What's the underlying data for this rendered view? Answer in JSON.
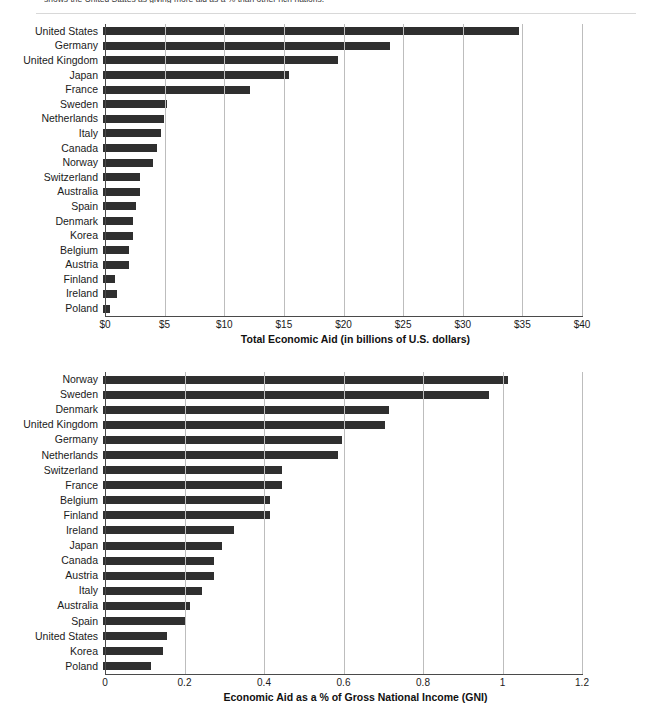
{
  "page": {
    "top_caption": "shows the United States as giving more aid as a % than other rich nations."
  },
  "chart_data": [
    {
      "id": "total-economic-aid",
      "type": "bar",
      "orientation": "horizontal",
      "title": "",
      "xlabel": "Total Economic Aid (in billions of U.S. dollars)",
      "ylabel": "",
      "xlim": [
        0,
        40
      ],
      "xticks": [
        0,
        5,
        10,
        15,
        20,
        25,
        30,
        35,
        40
      ],
      "xticklabels": [
        "$0",
        "$5",
        "$10",
        "$15",
        "$20",
        "$25",
        "$30",
        "$35",
        "$40"
      ],
      "grid": true,
      "legend": "none",
      "bar_color": "#2f2f2f",
      "categories": [
        "United States",
        "Germany",
        "United Kingdom",
        "Japan",
        "France",
        "Sweden",
        "Netherlands",
        "Italy",
        "Canada",
        "Norway",
        "Switzerland",
        "Australia",
        "Spain",
        "Denmark",
        "Korea",
        "Belgium",
        "Austria",
        "Finland",
        "Ireland",
        "Poland"
      ],
      "values": [
        34.9,
        24.1,
        19.7,
        15.6,
        12.3,
        5.4,
        5.1,
        4.9,
        4.5,
        4.2,
        3.1,
        3.1,
        2.8,
        2.5,
        2.5,
        2.2,
        2.2,
        1.0,
        1.2,
        0.6
      ]
    },
    {
      "id": "aid-as-pct-gni",
      "type": "bar",
      "orientation": "horizontal",
      "title": "",
      "xlabel": "Economic Aid as a % of Gross National Income (GNI)",
      "ylabel": "",
      "xlim": [
        0,
        1.2
      ],
      "xticks": [
        0,
        0.2,
        0.4,
        0.6,
        0.8,
        1,
        1.2
      ],
      "xticklabels": [
        "0",
        "0.2",
        "0.4",
        "0.6",
        "0.8",
        "1",
        "1.2"
      ],
      "grid": true,
      "legend": "none",
      "bar_color": "#2f2f2f",
      "categories": [
        "Norway",
        "Sweden",
        "Denmark",
        "United Kingdom",
        "Germany",
        "Netherlands",
        "Switzerland",
        "France",
        "Belgium",
        "Finland",
        "Ireland",
        "Japan",
        "Canada",
        "Austria",
        "Italy",
        "Australia",
        "Spain",
        "United States",
        "Korea",
        "Poland"
      ],
      "values": [
        1.02,
        0.97,
        0.72,
        0.71,
        0.6,
        0.59,
        0.45,
        0.45,
        0.42,
        0.42,
        0.33,
        0.3,
        0.28,
        0.28,
        0.25,
        0.22,
        0.21,
        0.16,
        0.15,
        0.12
      ]
    }
  ]
}
